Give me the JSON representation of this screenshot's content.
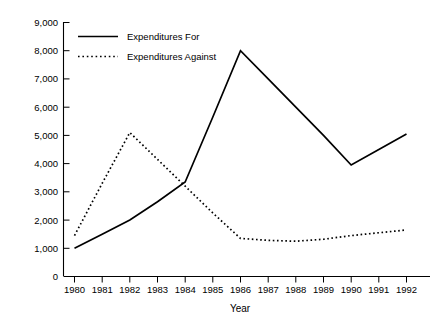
{
  "chart_data": {
    "type": "line",
    "title": "",
    "subtitle": "",
    "xlabel": "Year",
    "ylabel": "",
    "x": [
      1980,
      1981,
      1982,
      1983,
      1984,
      1985,
      1986,
      1987,
      1988,
      1989,
      1990,
      1991,
      1992
    ],
    "categories": [
      "1980",
      "1981",
      "1982",
      "1983",
      "1984",
      "1985",
      "1986",
      "1987",
      "1988",
      "1989",
      "1990",
      "1991",
      "1992"
    ],
    "series": [
      {
        "name": "Expenditures  For",
        "style": "solid",
        "color": "#000000",
        "values": [
          1000,
          1500,
          2000,
          2650,
          3350,
          5650,
          8000,
          7000,
          6000,
          5000,
          3950,
          4500,
          5050
        ]
      },
      {
        "name": "Expenditures  Against",
        "style": "dotted",
        "color": "#000000",
        "values": [
          1450,
          3300,
          5100,
          4150,
          3200,
          2250,
          1350,
          1280,
          1250,
          1320,
          1450,
          1550,
          1650
        ]
      }
    ],
    "ylim": [
      0,
      9000
    ],
    "xlim": [
      1980,
      1992
    ],
    "yticks": [
      0,
      1000,
      2000,
      3000,
      4000,
      5000,
      6000,
      7000,
      8000,
      9000
    ],
    "ytick_labels": [
      "0",
      "1,000",
      "2,000",
      "3,000",
      "4,000",
      "5,000",
      "6,000",
      "7,000",
      "8,000",
      "9,000"
    ],
    "grid": false,
    "legend_position": "inside-top-left",
    "background_color": "#ffffff",
    "axis_color": "#000000"
  },
  "legend": {
    "entries": [
      {
        "label": "Expenditures  For"
      },
      {
        "label": "Expenditures  Against"
      }
    ]
  },
  "axes": {
    "x_title": "Year"
  }
}
